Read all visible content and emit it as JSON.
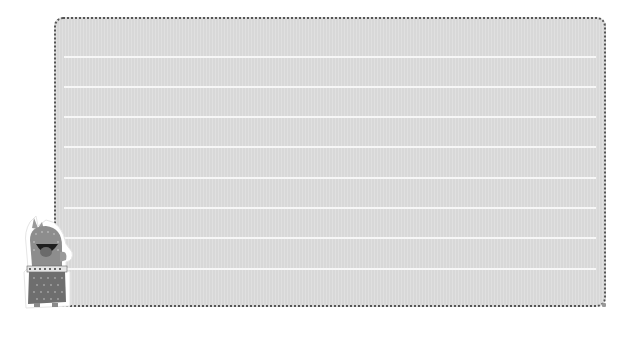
{
  "notepad": {
    "style": "lined-paper",
    "line_count": 8,
    "line_offsets_px": [
      37,
      67,
      97,
      127,
      158,
      188,
      218,
      249
    ],
    "colors": {
      "paper": "#dcdcdc",
      "line": "#f7f7f7",
      "border": "#555555",
      "background": "#ffffff"
    }
  },
  "sticker": {
    "subject": "cactus-character",
    "colors": {
      "body": "#8a8a8a",
      "skirt": "#6e6e6e",
      "outline": "#ffffff"
    }
  }
}
